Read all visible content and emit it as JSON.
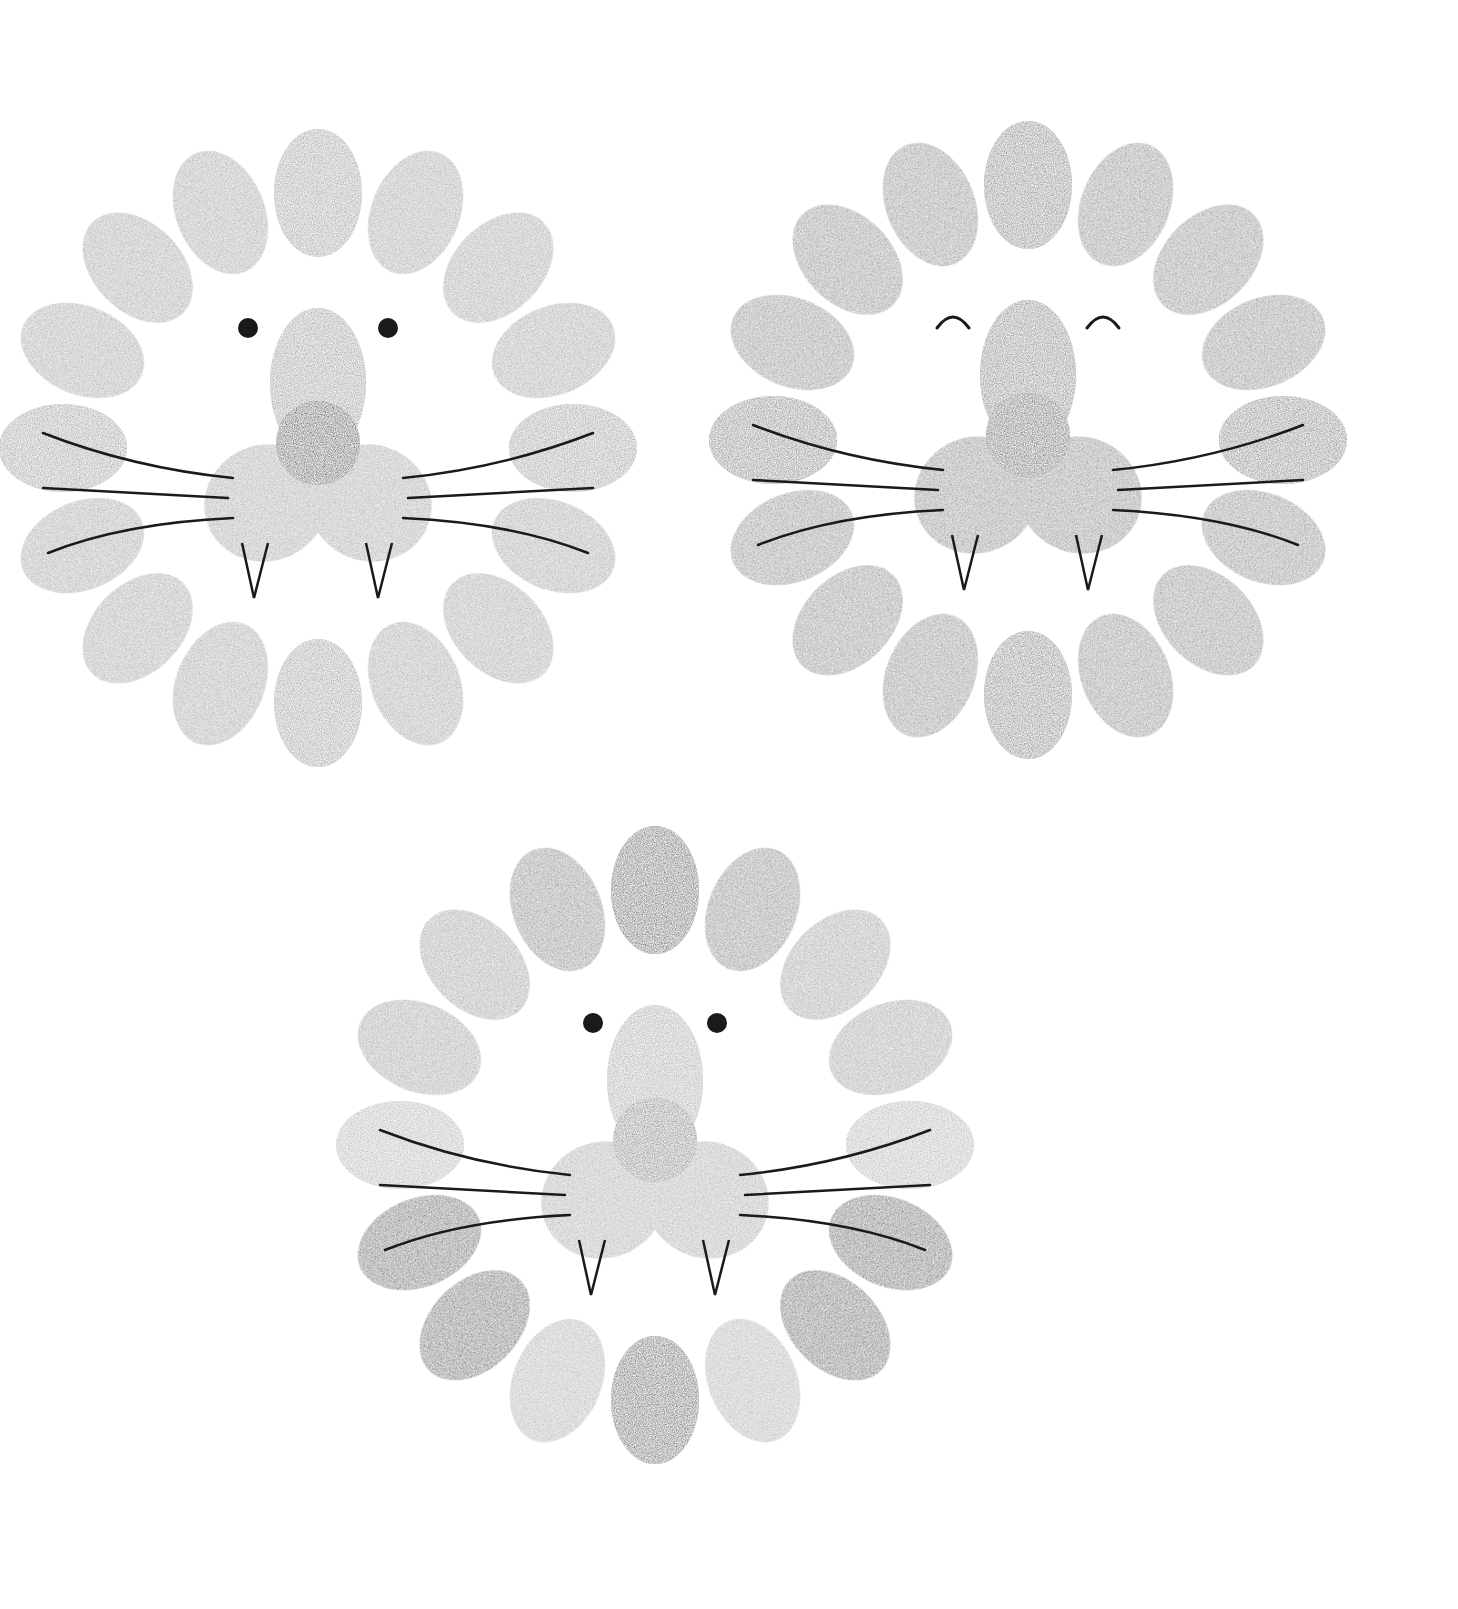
{
  "canvas": {
    "width": 1458,
    "height": 1609,
    "background": "#ffffff"
  },
  "ink": {
    "line": "#1a1a1a"
  },
  "lions": [
    {
      "id": "lion-top-left",
      "cx": 318,
      "cy": 448,
      "mane_radius": 255,
      "print_rx": 44,
      "print_ry": 64,
      "eyes": "dots",
      "eye_offset_x": 70,
      "eye_y": -120,
      "mane_colors": [
        "#a9a9a9",
        "#a9a9a9",
        "#a9a9a9",
        "#a9a9a9",
        "#a9a9a9",
        "#a9a9a9",
        "#a9a9a9",
        "#a9a9a9",
        "#a9a9a9",
        "#a9a9a9",
        "#a9a9a9",
        "#a9a9a9",
        "#a9a9a9",
        "#a9a9a9",
        "#a9a9a9",
        "#a9a9a9"
      ],
      "nose_bridge": "#a6a6a6",
      "nose_tip": "#5a5a5a",
      "muzzle": "#ababab"
    },
    {
      "id": "lion-top-right",
      "cx": 1028,
      "cy": 440,
      "mane_radius": 255,
      "print_rx": 44,
      "print_ry": 64,
      "eyes": "closed-arcs",
      "eye_offset_x": 75,
      "eye_y": -118,
      "mane_colors": [
        "#8f8f8f",
        "#8f8f8f",
        "#8f8f8f",
        "#8f8f8f",
        "#8f8f8f",
        "#8f8f8f",
        "#8f8f8f",
        "#8f8f8f",
        "#8f8f8f",
        "#8f8f8f",
        "#8f8f8f",
        "#8f8f8f",
        "#8f8f8f",
        "#8f8f8f",
        "#8f8f8f",
        "#8f8f8f"
      ],
      "nose_bridge": "#909090",
      "nose_tip": "#6e6e6e",
      "muzzle": "#8c8c8c"
    },
    {
      "id": "lion-bottom",
      "cx": 655,
      "cy": 1145,
      "mane_radius": 255,
      "print_rx": 44,
      "print_ry": 64,
      "eyes": "dots",
      "eye_offset_x": 62,
      "eye_y": -122,
      "mane_colors": [
        "#6c6c6c",
        "#8a8a8a",
        "#a6a6a6",
        "#a6a6a6",
        "#bdbdbd",
        "#5e5e5e",
        "#5e5e5e",
        "#b5b5b5",
        "#6a6a6a",
        "#b5b5b5",
        "#5e5e5e",
        "#5e5e5e",
        "#bdbdbd",
        "#a6a6a6",
        "#a6a6a6",
        "#8a8a8a"
      ],
      "nose_bridge": "#b3b3b3",
      "nose_tip": "#8d8d8d",
      "muzzle": "#b0b0b0"
    }
  ]
}
